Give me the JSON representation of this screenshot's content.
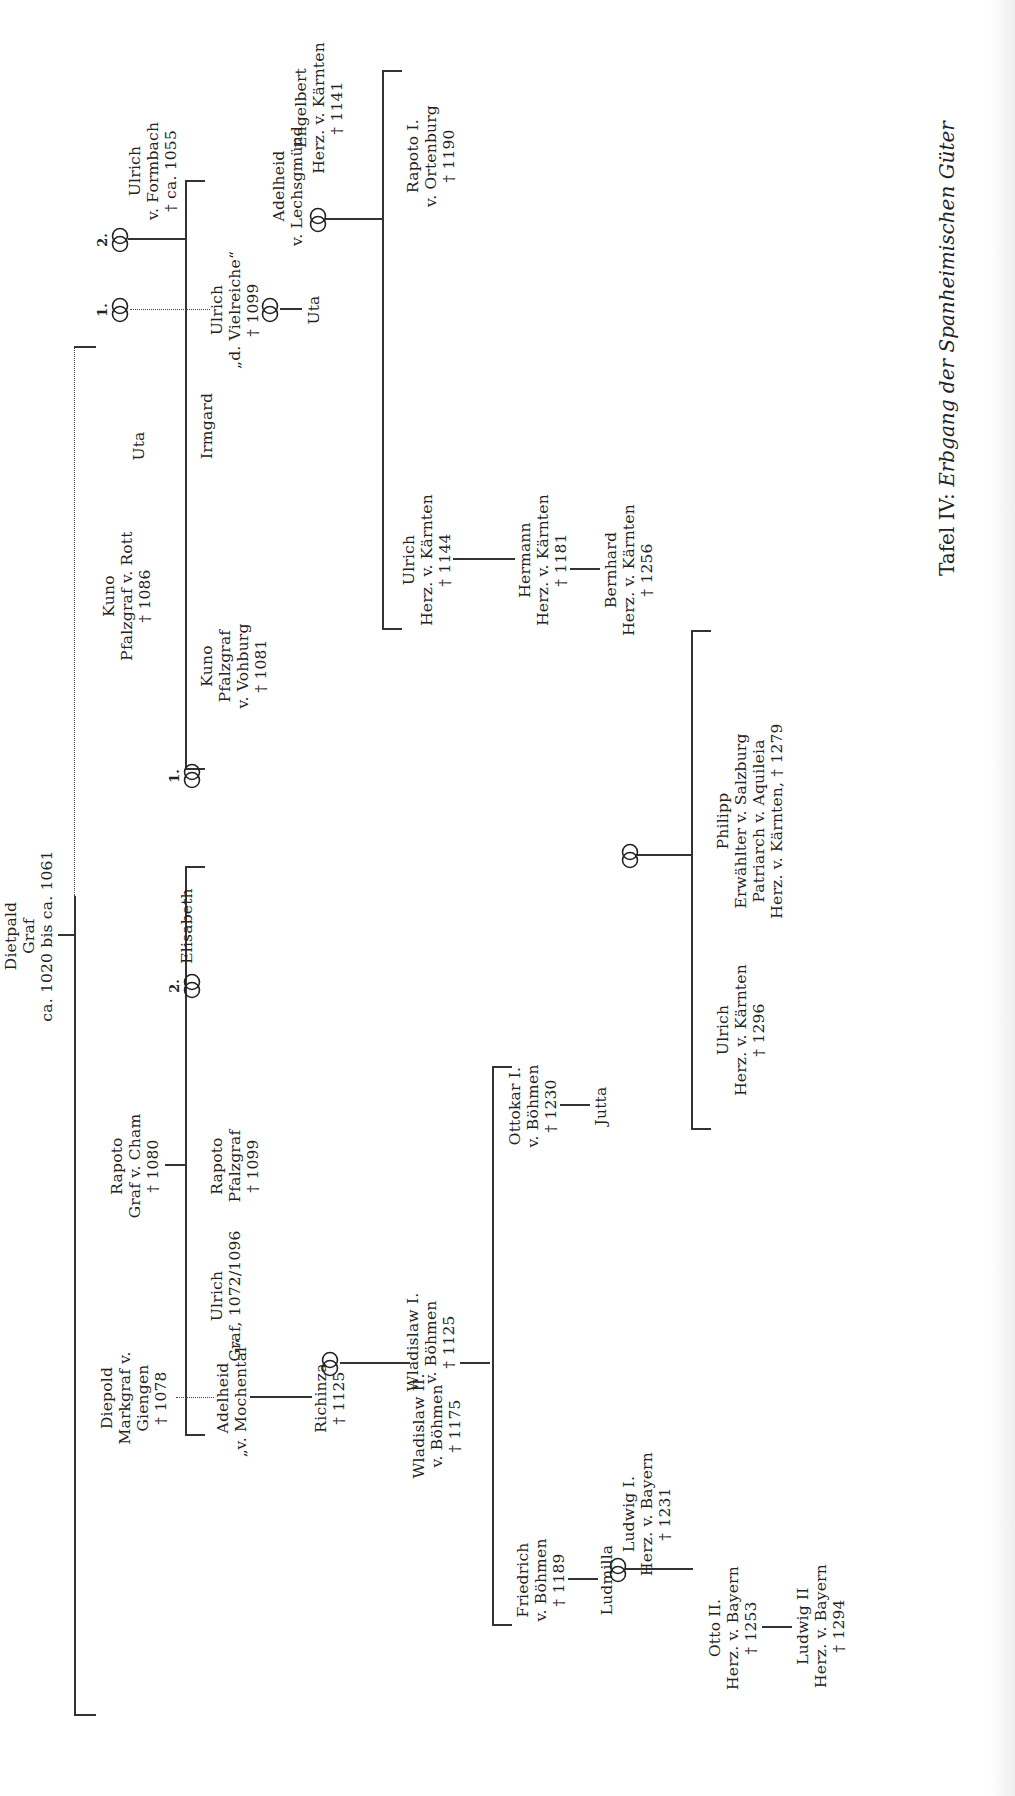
{
  "plate": {
    "label": "Tafel IV:",
    "title": "Erbgang der Spanheimischen Güter"
  },
  "persons": {
    "dietpald": [
      "Dietpald",
      "Graf",
      "ca. 1020 bis ca. 1061"
    ],
    "diepold": [
      "Diepold",
      "Markgraf v.",
      "Giengen",
      "† 1078"
    ],
    "adelheid_mochental": [
      "Adelheid",
      "„v. Mochental“"
    ],
    "richinza": [
      "Richinza",
      "† 1125"
    ],
    "wladislaw1": [
      "Wladislaw I.",
      "v. Böhmen",
      "† 1125"
    ],
    "wladislaw2": [
      "Wladislaw II.",
      "v. Böhmen",
      "† 1175"
    ],
    "friedrich": [
      "Friedrich",
      "v. Böhmen",
      "† 1189"
    ],
    "ludmilla": [
      "Ludmilla"
    ],
    "ludwig1": [
      "Ludwig I.",
      "Herz. v. Bayern",
      "† 1231"
    ],
    "otto2": [
      "Otto II.",
      "Herz. v. Bayern",
      "† 1253"
    ],
    "ludwig2": [
      "Ludwig II",
      "Herz. v. Bayern",
      "† 1294"
    ],
    "ottokar1": [
      "Ottokar I.",
      "v. Böhmen",
      "† 1230"
    ],
    "jutta": [
      "Jutta"
    ],
    "rapoto_cham": [
      "Rapoto",
      "Graf v. Cham",
      "† 1080"
    ],
    "ulrich_graf": [
      "Ulrich",
      "Graf, 1072/1096"
    ],
    "rapoto_pfalzgraf": [
      "Rapoto",
      "Pfalzgraf",
      "† 1099"
    ],
    "elisabeth": [
      "Elisabeth"
    ],
    "kuno_rott": [
      "Kuno",
      "Pfalzgraf v. Rott",
      "† 1086"
    ],
    "kuno_vohburg": [
      "Kuno",
      "Pfalzgraf",
      "v. Vohburg",
      "† 1081"
    ],
    "irmgard": [
      "Irmgard"
    ],
    "uta_top": [
      "Uta"
    ],
    "ulrich_formbach": [
      "Ulrich",
      "v. Formbach",
      "† ca. 1055"
    ],
    "ulrich_vielreiche": [
      "Ulrich",
      "„d. Vielreiche“",
      "† 1099"
    ],
    "adelheid_lechsgmund": [
      "Adelheid",
      "v. Lechsgmünd"
    ],
    "uta_lower": [
      "Uta"
    ],
    "engelbert": [
      "Engelbert",
      "Herz. v. Kärnten",
      "† 1141"
    ],
    "rapoto_ortenburg": [
      "Rapoto I.",
      "v. Ortenburg",
      "† 1190"
    ],
    "ulrich_1144": [
      "Ulrich",
      "Herz. v. Kärnten",
      "† 1144"
    ],
    "hermann": [
      "Hermann",
      "Herz. v. Kärnten",
      "† 1181"
    ],
    "bernhard": [
      "Bernhard",
      "Herz. v. Kärnten",
      "† 1256"
    ],
    "ulrich_1296": [
      "Ulrich",
      "Herz. v. Kärnten",
      "† 1296"
    ],
    "philipp": [
      "Philipp",
      "Erwählter v. Salzburg",
      "Patriarch v. Aquileia",
      "Herz. v. Kärnten, † 1279"
    ]
  },
  "marriages": {
    "dietpald_2": {
      "symbol": "marriage-rings-icon",
      "number": "2."
    },
    "dietpald_1": {
      "symbol": "marriage-rings-icon",
      "number": "1."
    },
    "kuno_2": {
      "symbol": "marriage-rings-icon",
      "number": "2."
    },
    "uta_1": {
      "symbol": "marriage-rings-icon",
      "number": "1."
    },
    "ulrich_adelheid": {
      "symbol": "marriage-rings-icon",
      "number": ""
    },
    "uta_engelbert": {
      "symbol": "marriage-rings-icon",
      "number": ""
    },
    "richinza_wladislaw": {
      "symbol": "marriage-rings-icon",
      "number": ""
    },
    "ludmilla_ludwig": {
      "symbol": "marriage-rings-icon",
      "number": ""
    },
    "bernhard_philipp": {
      "symbol": "marriage-rings-icon",
      "number": ""
    }
  },
  "colors": {
    "ink": "#222222",
    "paper": "#ffffff"
  }
}
